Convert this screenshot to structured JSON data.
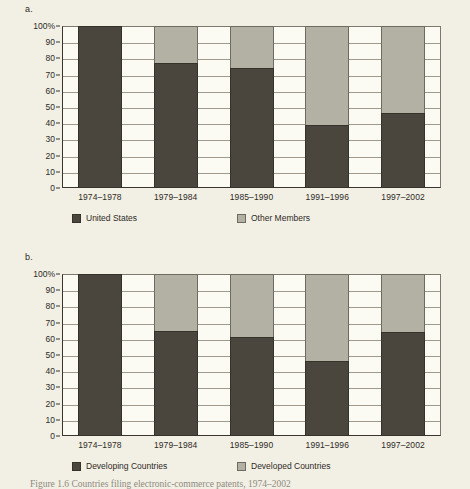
{
  "figure": {
    "background_color": "#f2efe4",
    "caption_partial": "Figure 1.6  Countries filing electronic-commerce patents, 1974–2002"
  },
  "colors": {
    "series_dark": "#4a463d",
    "series_light": "#b3b0a4",
    "plot_background": "#fbfaf3",
    "axis": "#3a362f",
    "gridline": "#9e998c"
  },
  "panels": [
    {
      "letter": "a.",
      "chart_data": {
        "type": "bar",
        "stacked": true,
        "normalized_percent": true,
        "title": "",
        "xlabel": "",
        "ylabel": "",
        "ylim": [
          0,
          100
        ],
        "yticks": [
          0,
          10,
          20,
          30,
          40,
          50,
          60,
          70,
          80,
          90,
          100
        ],
        "ytick_labels": [
          "0",
          "10",
          "20",
          "30",
          "40",
          "50",
          "60",
          "70",
          "80",
          "90",
          "100%"
        ],
        "grid": true,
        "legend_position": "below",
        "categories": [
          "1974–1978",
          "1979–1984",
          "1985–1990",
          "1991–1996",
          "1997–2002"
        ],
        "series": [
          {
            "name": "United States",
            "color": "#4a463d",
            "values": [
              100,
              77,
              74,
              39,
              46
            ]
          },
          {
            "name": "Other Members",
            "color": "#b3b0a4",
            "values": [
              0,
              23,
              26,
              61,
              54
            ]
          }
        ]
      }
    },
    {
      "letter": "b.",
      "chart_data": {
        "type": "bar",
        "stacked": true,
        "normalized_percent": true,
        "title": "",
        "xlabel": "",
        "ylabel": "",
        "ylim": [
          0,
          100
        ],
        "yticks": [
          0,
          10,
          20,
          30,
          40,
          50,
          60,
          70,
          80,
          90,
          100
        ],
        "ytick_labels": [
          "0",
          "10",
          "20",
          "30",
          "40",
          "50",
          "60",
          "70",
          "80",
          "90",
          "100%"
        ],
        "grid": true,
        "legend_position": "below",
        "categories": [
          "1974–1978",
          "1979–1984",
          "1985–1990",
          "1991–1996",
          "1997–2002"
        ],
        "series": [
          {
            "name": "Developing Countries",
            "color": "#4a463d",
            "values": [
              100,
              65,
              61,
              46,
              64
            ]
          },
          {
            "name": "Developed Countries",
            "color": "#b3b0a4",
            "values": [
              0,
              35,
              39,
              54,
              36
            ]
          }
        ]
      }
    }
  ]
}
